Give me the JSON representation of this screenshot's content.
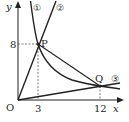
{
  "diagram": {
    "type": "coordinate-graph",
    "axes": {
      "x_label": "x",
      "y_label": "y",
      "origin_label": "O"
    },
    "ticks": {
      "x": [
        "3",
        "12"
      ],
      "y": [
        "8"
      ]
    },
    "curves": [
      {
        "id": "1",
        "label": "①",
        "kind": "hyperbola",
        "equation": "y = 24/x"
      },
      {
        "id": "2",
        "label": "②",
        "kind": "line",
        "equation": "y = 8/3 x"
      },
      {
        "id": "3",
        "label": "③",
        "kind": "line",
        "equation": "y = 1/6 x"
      }
    ],
    "points": [
      {
        "label": "P",
        "x": 3,
        "y": 8
      },
      {
        "label": "Q",
        "x": 12,
        "y": 2
      }
    ],
    "segments": [
      {
        "from": "P",
        "to": "Q"
      }
    ]
  },
  "labels": {
    "y_axis": "y",
    "x_axis": "x",
    "origin": "O",
    "tick_x_3": "3",
    "tick_x_12": "12",
    "tick_y_8": "8",
    "curve1": "①",
    "curve2": "②",
    "curve3": "③",
    "point_p": "P",
    "point_q": "Q"
  }
}
